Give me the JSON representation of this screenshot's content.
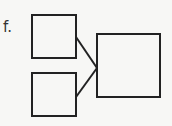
{
  "label": "f.",
  "colors": {
    "background": "#f7f7f5",
    "stroke": "#222222"
  },
  "diagram": {
    "boxes": [
      {
        "id": "top-left-box",
        "x": 32,
        "y": 15,
        "w": 44,
        "h": 43
      },
      {
        "id": "bottom-left-box",
        "x": 32,
        "y": 73,
        "w": 44,
        "h": 43
      },
      {
        "id": "right-box",
        "x": 97,
        "y": 34,
        "w": 63,
        "h": 63
      }
    ],
    "connectors": [
      {
        "id": "top-connector",
        "x1": 76,
        "y1": 37,
        "x2": 97,
        "y2": 68
      },
      {
        "id": "bottom-connector",
        "x1": 76,
        "y1": 97,
        "x2": 97,
        "y2": 68
      }
    ]
  }
}
